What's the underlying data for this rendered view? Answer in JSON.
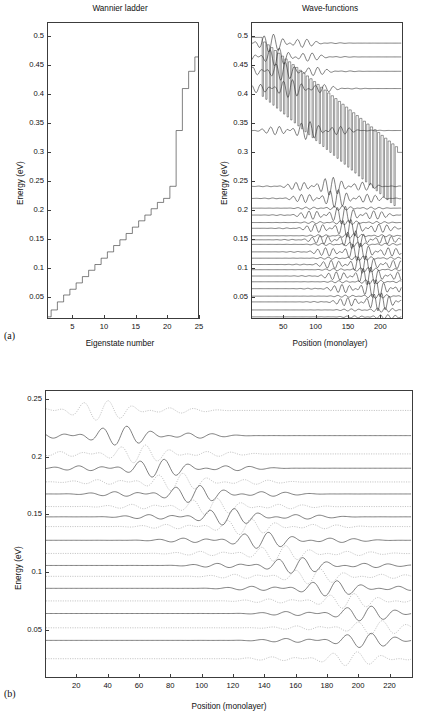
{
  "figure": {
    "panel_a_label": "(a)",
    "panel_b_label": "(b)"
  },
  "chart_data": [
    {
      "id": "wannier_ladder",
      "type": "line",
      "title": "Wannier ladder",
      "xlabel": "Eigenstate number",
      "ylabel": "Energy (eV)",
      "xlim": [
        1,
        25
      ],
      "ylim": [
        0.012,
        0.525
      ],
      "xticks": [
        5,
        10,
        15,
        20,
        25
      ],
      "yticks": [
        0.05,
        0.1,
        0.15,
        0.2,
        0.25,
        0.3,
        0.35,
        0.4,
        0.45,
        0.5
      ],
      "ytick_labels": [
        "0.05",
        "0.1",
        "0.15",
        "0.2",
        "0.25",
        "0.3",
        "0.35",
        "0.4",
        "0.45",
        "0.5"
      ],
      "xtick_labels": [
        "5",
        "10",
        "15",
        "20",
        "25"
      ],
      "grid": false,
      "legend": "none",
      "style": "stairs",
      "categories": [
        1,
        2,
        3,
        4,
        5,
        6,
        7,
        8,
        9,
        10,
        11,
        12,
        13,
        14,
        15,
        16,
        17,
        18,
        19,
        20,
        21,
        22,
        23,
        24,
        25
      ],
      "values": [
        0.014,
        0.026,
        0.04,
        0.052,
        0.062,
        0.073,
        0.084,
        0.095,
        0.105,
        0.116,
        0.127,
        0.138,
        0.148,
        0.159,
        0.17,
        0.181,
        0.191,
        0.202,
        0.213,
        0.22,
        0.241,
        0.338,
        0.411,
        0.441,
        0.466
      ]
    },
    {
      "id": "wave_functions_overview",
      "type": "line",
      "title": "Wave-functions",
      "xlabel": "Position (monolayer)",
      "ylabel": "Energy (eV)",
      "xlim": [
        0,
        235
      ],
      "ylim": [
        0.012,
        0.525
      ],
      "xticks": [
        50,
        100,
        150,
        200
      ],
      "xtick_labels": [
        "50",
        "100",
        "150",
        "200"
      ],
      "yticks": [
        0.05,
        0.1,
        0.15,
        0.2,
        0.25,
        0.3,
        0.35,
        0.4,
        0.45,
        0.5
      ],
      "ytick_labels": [
        "0.05",
        "0.1",
        "0.15",
        "0.2",
        "0.25",
        "0.3",
        "0.35",
        "0.4",
        "0.45",
        "0.5"
      ],
      "grid": false,
      "legend": "none",
      "description": "Tilted superlattice potential with barrier teeth decreasing from 0.5 eV at left to 0.30 eV at right; eigenstate wave-functions drawn on their energy baselines",
      "potential": {
        "left_plateau_energy": 0.5,
        "right_plateau_energy": 0.3,
        "barrier_top_start": 0.492,
        "barrier_top_end": 0.305,
        "well_bottom_start": 0.4,
        "well_bottom_end": 0.205,
        "n_periods": 38,
        "period_start_x": 16,
        "period_end_x": 228
      },
      "state_baselines": [
        0.49,
        0.466,
        0.441,
        0.411,
        0.338,
        0.241,
        0.22,
        0.203,
        0.191,
        0.178,
        0.168,
        0.155,
        0.148,
        0.14,
        0.127,
        0.116,
        0.105,
        0.096,
        0.085,
        0.075,
        0.063,
        0.05,
        0.04,
        0.026,
        0.014
      ],
      "states_with_visible_oscillation": [
        0.49,
        0.466,
        0.441,
        0.411,
        0.338,
        0.241,
        0.22,
        0.191,
        0.168,
        0.148,
        0.127,
        0.105,
        0.085,
        0.063,
        0.04
      ]
    },
    {
      "id": "wave_functions_detail",
      "type": "line",
      "title": "",
      "xlabel": "Position (monolayer)",
      "ylabel": "Energy (eV)",
      "xlim": [
        0,
        235
      ],
      "ylim": [
        0.008,
        0.258
      ],
      "xticks": [
        20,
        40,
        60,
        80,
        100,
        120,
        140,
        160,
        180,
        200,
        220
      ],
      "xtick_labels": [
        "20",
        "40",
        "60",
        "80",
        "100",
        "120",
        "140",
        "160",
        "180",
        "200",
        "220"
      ],
      "yticks": [
        0.05,
        0.1,
        0.15,
        0.2,
        0.25
      ],
      "ytick_labels": [
        "0.05",
        "0.1",
        "0.15",
        "0.2",
        "0.25"
      ],
      "grid": false,
      "legend": "none",
      "description": "Fifteen Wannier-Stark eigenstates on equally spaced energy baselines; solid curves alternate with dotted curves, each localized further to the right as energy decreases",
      "series": [
        {
          "name": "state-1",
          "baseline": 0.241,
          "style": "dotted",
          "center_x": 36,
          "amplitude": 0.0088
        },
        {
          "name": "state-2",
          "baseline": 0.219,
          "style": "solid",
          "center_x": 48,
          "amplitude": 0.0085
        },
        {
          "name": "state-3",
          "baseline": 0.203,
          "style": "dotted",
          "center_x": 60,
          "amplitude": 0.008
        },
        {
          "name": "state-4",
          "baseline": 0.1905,
          "style": "solid",
          "center_x": 72,
          "amplitude": 0.008
        },
        {
          "name": "state-5",
          "baseline": 0.1785,
          "style": "dotted",
          "center_x": 84,
          "amplitude": 0.0078
        },
        {
          "name": "state-6",
          "baseline": 0.168,
          "style": "solid",
          "center_x": 95,
          "amplitude": 0.0076
        },
        {
          "name": "state-7",
          "baseline": 0.157,
          "style": "dotted",
          "center_x": 106,
          "amplitude": 0.0074
        },
        {
          "name": "state-8",
          "baseline": 0.148,
          "style": "solid",
          "center_x": 117,
          "amplitude": 0.0074
        },
        {
          "name": "state-9",
          "baseline": 0.1395,
          "style": "dotted",
          "center_x": 128,
          "amplitude": 0.0072
        },
        {
          "name": "state-10",
          "baseline": 0.1275,
          "style": "solid",
          "center_x": 139,
          "amplitude": 0.0072
        },
        {
          "name": "state-11",
          "baseline": 0.116,
          "style": "dotted",
          "center_x": 150,
          "amplitude": 0.007
        },
        {
          "name": "state-12",
          "baseline": 0.1055,
          "style": "solid",
          "center_x": 161,
          "amplitude": 0.007
        },
        {
          "name": "state-13",
          "baseline": 0.096,
          "style": "dotted",
          "center_x": 172,
          "amplitude": 0.0068
        },
        {
          "name": "state-14",
          "baseline": 0.0855,
          "style": "solid",
          "center_x": 183,
          "amplitude": 0.0068
        },
        {
          "name": "state-15",
          "baseline": 0.0745,
          "style": "dotted",
          "center_x": 194,
          "amplitude": 0.0066
        },
        {
          "name": "state-16",
          "baseline": 0.0635,
          "style": "solid",
          "center_x": 205,
          "amplitude": 0.0066
        },
        {
          "name": "state-17",
          "baseline": 0.051,
          "style": "dotted",
          "center_x": 212,
          "amplitude": 0.0064
        },
        {
          "name": "state-18",
          "baseline": 0.04,
          "style": "solid",
          "center_x": 205,
          "amplitude": 0.0064
        },
        {
          "name": "state-19",
          "baseline": 0.024,
          "style": "dotted",
          "center_x": 196,
          "amplitude": 0.0062
        }
      ]
    }
  ]
}
